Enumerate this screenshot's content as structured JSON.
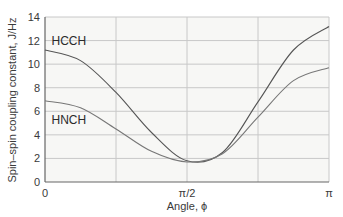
{
  "chart_data": {
    "type": "line",
    "title": "",
    "xlabel": "Angle, ϕ",
    "ylabel": "Spin–spin coupling constant, J/Hz",
    "xlim": [
      0,
      3.14159
    ],
    "ylim": [
      0,
      14
    ],
    "grid": true,
    "x_ticks": [
      {
        "value": 0,
        "label": "0"
      },
      {
        "value": 1.5708,
        "label": "π/2"
      },
      {
        "value": 3.14159,
        "label": "π"
      }
    ],
    "x_gridlines": [
      0.7854,
      1.5708,
      2.3562
    ],
    "y_ticks": [
      0,
      2,
      4,
      6,
      8,
      10,
      12,
      14
    ],
    "legend": "inline labels",
    "series": [
      {
        "name": "HCCH",
        "color": "#555555",
        "formula": "J = 7.5 cos^2(phi) - 2 cos(phi) + 1.7 (approx)",
        "x": [
          0,
          0.3927,
          0.7854,
          1.1781,
          1.5708,
          1.9635,
          2.3562,
          2.7489,
          3.14159
        ],
        "values": [
          11.2,
          10.3,
          7.6,
          4.2,
          1.8,
          2.5,
          6.8,
          11.2,
          13.2
        ]
      },
      {
        "name": "HNCH",
        "color": "#777777",
        "x": [
          0,
          0.3927,
          0.7854,
          1.1781,
          1.5708,
          1.9635,
          2.3562,
          2.7489,
          3.14159
        ],
        "values": [
          6.9,
          6.3,
          4.5,
          2.6,
          1.7,
          2.4,
          5.5,
          8.6,
          9.7
        ]
      }
    ],
    "labels": [
      {
        "text": "HCCH",
        "x": 0.05,
        "y": 12.0
      },
      {
        "text": "HNCH",
        "x": 0.05,
        "y": 5.3
      }
    ]
  }
}
